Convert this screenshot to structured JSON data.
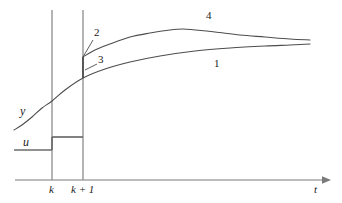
{
  "figure": {
    "type": "line-diagram",
    "background_color": "#ffffff",
    "axis_color": "#7a7a7a",
    "curve_color": "#4d4d4d",
    "step_color": "#6b6b6b",
    "label_color": "#1a1a1a"
  },
  "axes": {
    "x_axis": {
      "name": "t-axis",
      "label": "t",
      "arrow": true,
      "y_pixel": 180,
      "x_start": 15,
      "x_end": 326
    },
    "tick_labels": [
      {
        "text": "k",
        "x": 52
      },
      {
        "text": "k + 1",
        "x": 83
      }
    ],
    "vertical_lines": [
      {
        "name": "grid-line-k",
        "x": 52,
        "y_top": 10,
        "y_bottom": 180
      },
      {
        "name": "grid-line-k-plus-1",
        "x": 83,
        "y_top": 10,
        "y_bottom": 180
      }
    ]
  },
  "labels": {
    "output": "y",
    "input": "u",
    "time": "t",
    "tick_k": "k",
    "tick_k_plus_1": "k + 1",
    "curve_one": "1",
    "curve_two": "2",
    "curve_three": "3",
    "curve_four": "4"
  },
  "chart_data": {
    "type": "line",
    "xlabel": "t",
    "ylabel": "y",
    "grid": false,
    "legend": "inline-annotations",
    "xlim": [
      0,
      342
    ],
    "ylim": [
      203,
      0
    ],
    "annotations": [
      {
        "label": "y",
        "x": 22,
        "y": 112,
        "style": "italic",
        "meaning": "output-signal"
      },
      {
        "label": "u",
        "x": 26,
        "y": 143,
        "style": "italic",
        "meaning": "input-signal"
      },
      {
        "label": "2",
        "x": 96,
        "y": 35,
        "meaning": "upper-curve-at-k-plus-1"
      },
      {
        "label": "3",
        "x": 100,
        "y": 60,
        "meaning": "jump-segment-at-k-plus-1"
      },
      {
        "label": "4",
        "x": 208,
        "y": 16,
        "meaning": "upper-response-curve"
      },
      {
        "label": "1",
        "x": 215,
        "y": 64,
        "meaning": "lower-response-curve"
      },
      {
        "label": "t",
        "x": 316,
        "y": 188,
        "style": "italic",
        "meaning": "time-axis"
      }
    ],
    "series": [
      {
        "name": "1",
        "description": "lower response curve, continuous through k and k+1",
        "points": [
          [
            14,
            130
          ],
          [
            22,
            125
          ],
          [
            32,
            117
          ],
          [
            42,
            108
          ],
          [
            52,
            101
          ],
          [
            65,
            90
          ],
          [
            83,
            78
          ],
          [
            105,
            69
          ],
          [
            130,
            62
          ],
          [
            160,
            56
          ],
          [
            195,
            51
          ],
          [
            230,
            48
          ],
          [
            265,
            46
          ],
          [
            290,
            45
          ],
          [
            310,
            44
          ]
        ]
      },
      {
        "name": "4",
        "description": "upper response curve, rises after k+1, overshoots then settles",
        "points": [
          [
            83,
            57
          ],
          [
            95,
            50
          ],
          [
            110,
            44
          ],
          [
            130,
            37
          ],
          [
            150,
            33
          ],
          [
            170,
            30
          ],
          [
            183,
            29
          ],
          [
            195,
            30
          ],
          [
            215,
            32
          ],
          [
            240,
            35
          ],
          [
            265,
            37
          ],
          [
            290,
            39
          ],
          [
            310,
            40
          ]
        ]
      },
      {
        "name": "2",
        "description": "leader line from label 2 to intersection at k+1",
        "points": [
          [
            93,
            40
          ],
          [
            83,
            57
          ]
        ]
      },
      {
        "name": "3",
        "description": "leader line from label 3 to jump segment at k+1",
        "points": [
          [
            97,
            64
          ],
          [
            85,
            70
          ]
        ]
      },
      {
        "name": "jump",
        "description": "vertical jump segment on k+1 between curve 1 and curve 4",
        "points": [
          [
            83,
            57
          ],
          [
            83,
            78
          ]
        ]
      }
    ],
    "step_input": {
      "name": "u",
      "description": "piecewise-constant input: low level before k, higher level between k and k+1",
      "segments": [
        {
          "from": [
            14,
            150
          ],
          "to": [
            52,
            150
          ]
        },
        {
          "from": [
            52,
            150
          ],
          "to": [
            52,
            137
          ]
        },
        {
          "from": [
            52,
            137
          ],
          "to": [
            83,
            137
          ]
        }
      ]
    }
  }
}
